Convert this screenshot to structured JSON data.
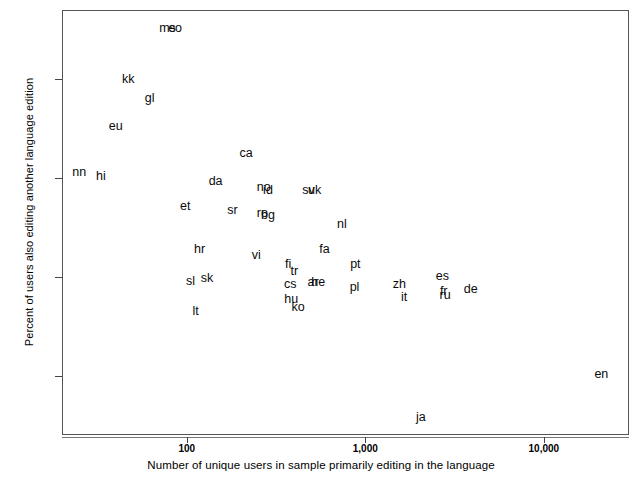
{
  "chart_data": {
    "type": "scatter",
    "title": "",
    "xlabel": "Number of unique users in sample primarily editing in the language",
    "ylabel": "Percent of users also editing another language edition",
    "xscale": "log",
    "xlim": [
      20,
      30000
    ],
    "ylim": [
      0.04,
      0.47
    ],
    "xticks": [
      100,
      1000,
      10000
    ],
    "xtick_labels": [
      "100",
      "1,000",
      "10,000"
    ],
    "yticks": [
      0.1,
      0.2,
      0.3,
      0.4
    ],
    "ytick_labels": [
      "10%",
      "20%",
      "30%",
      "40%"
    ],
    "grid": false,
    "legend": null,
    "point_label_mode": "text-labels-only",
    "points": [
      {
        "label": "ms",
        "x": 78,
        "y": 0.452
      },
      {
        "label": "eo",
        "x": 86,
        "y": 0.452
      },
      {
        "label": "kk",
        "x": 47,
        "y": 0.4
      },
      {
        "label": "gl",
        "x": 62,
        "y": 0.381
      },
      {
        "label": "eu",
        "x": 40,
        "y": 0.353
      },
      {
        "label": "nn",
        "x": 25,
        "y": 0.306
      },
      {
        "label": "hi",
        "x": 33,
        "y": 0.302
      },
      {
        "label": "ca",
        "x": 215,
        "y": 0.325
      },
      {
        "label": "da",
        "x": 145,
        "y": 0.297
      },
      {
        "label": "no",
        "x": 270,
        "y": 0.291
      },
      {
        "label": "id",
        "x": 285,
        "y": 0.288
      },
      {
        "label": "sv",
        "x": 480,
        "y": 0.288
      },
      {
        "label": "uk",
        "x": 520,
        "y": 0.288
      },
      {
        "label": "et",
        "x": 98,
        "y": 0.272
      },
      {
        "label": "sr",
        "x": 180,
        "y": 0.268
      },
      {
        "label": "ro",
        "x": 265,
        "y": 0.265
      },
      {
        "label": "bg",
        "x": 285,
        "y": 0.263
      },
      {
        "label": "nl",
        "x": 740,
        "y": 0.253
      },
      {
        "label": "hr",
        "x": 118,
        "y": 0.228
      },
      {
        "label": "vi",
        "x": 245,
        "y": 0.222
      },
      {
        "label": "fa",
        "x": 590,
        "y": 0.228
      },
      {
        "label": "fi",
        "x": 370,
        "y": 0.213
      },
      {
        "label": "tr",
        "x": 400,
        "y": 0.206
      },
      {
        "label": "pt",
        "x": 880,
        "y": 0.213
      },
      {
        "label": "es",
        "x": 2700,
        "y": 0.201
      },
      {
        "label": "sl",
        "x": 105,
        "y": 0.196
      },
      {
        "label": "sk",
        "x": 130,
        "y": 0.199
      },
      {
        "label": "cs",
        "x": 380,
        "y": 0.193
      },
      {
        "label": "ar",
        "x": 510,
        "y": 0.195
      },
      {
        "label": "he",
        "x": 545,
        "y": 0.195
      },
      {
        "label": "pl",
        "x": 870,
        "y": 0.19
      },
      {
        "label": "zh",
        "x": 1550,
        "y": 0.193
      },
      {
        "label": "fr",
        "x": 2750,
        "y": 0.186
      },
      {
        "label": "ru",
        "x": 2800,
        "y": 0.182
      },
      {
        "label": "de",
        "x": 3900,
        "y": 0.188
      },
      {
        "label": "it",
        "x": 1650,
        "y": 0.18
      },
      {
        "label": "hu",
        "x": 385,
        "y": 0.178
      },
      {
        "label": "ko",
        "x": 420,
        "y": 0.17
      },
      {
        "label": "lt",
        "x": 112,
        "y": 0.165
      },
      {
        "label": "en",
        "x": 21000,
        "y": 0.102
      },
      {
        "label": "ja",
        "x": 2050,
        "y": 0.058
      }
    ]
  }
}
